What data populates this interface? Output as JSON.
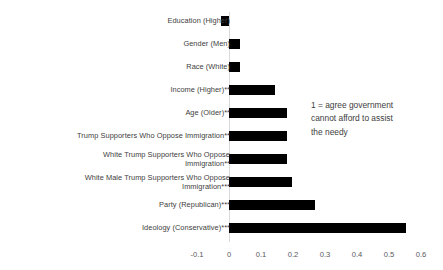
{
  "annotation": {
    "text": "1 = agree government\ncannot afford to assist\nthe needy"
  },
  "axis": {
    "tick_labels": [
      "-0.1",
      "0",
      "0.1",
      "0.2",
      "0.3",
      "0.4",
      "0.5",
      "0.6"
    ]
  },
  "chart_data": {
    "type": "bar",
    "orientation": "horizontal",
    "title": "",
    "xlabel": "",
    "ylabel": "",
    "xlim": [
      -0.1,
      0.6
    ],
    "xticks": [
      -0.1,
      0,
      0.1,
      0.2,
      0.3,
      0.4,
      0.5,
      0.6
    ],
    "grid": false,
    "legend": false,
    "bar_color": "#000000",
    "axis_line_color": "#d9d9d9",
    "annotation": "1 = agree government cannot afford to assist the needy",
    "categories": [
      "Education (Higher)",
      "Gender (Men)",
      "Race (White)",
      "Income (Higher)**",
      "Age (Older)**",
      "Trump Supporters Who Oppose Immigration**",
      "White Trump Supporters Who Oppose Immigration**",
      "White Male Trump Supporters Who Oppose Immigration***",
      "Party (Republican)***",
      "Ideology (Conservative)***"
    ],
    "values": [
      -0.025,
      0.035,
      0.035,
      0.145,
      0.18,
      0.18,
      0.18,
      0.198,
      0.27,
      0.553
    ]
  },
  "categories_display": [
    {
      "label": "Education (Higher)",
      "value": -0.025
    },
    {
      "label": "Gender (Men)",
      "value": 0.035
    },
    {
      "label": "Race (White)",
      "value": 0.035
    },
    {
      "label": "Income (Higher)**",
      "value": 0.145
    },
    {
      "label": "Age (Older)**",
      "value": 0.18
    },
    {
      "label": "Trump Supporters Who Oppose Immigration**",
      "value": 0.18
    },
    {
      "label": "White Trump Supporters Who Oppose\nImmigration**",
      "value": 0.18
    },
    {
      "label": "White Male Trump Supporters Who Oppose\nImmigration***",
      "value": 0.198
    },
    {
      "label": "Party (Republican)***",
      "value": 0.27
    },
    {
      "label": "Ideology (Conservative)***",
      "value": 0.553
    }
  ]
}
